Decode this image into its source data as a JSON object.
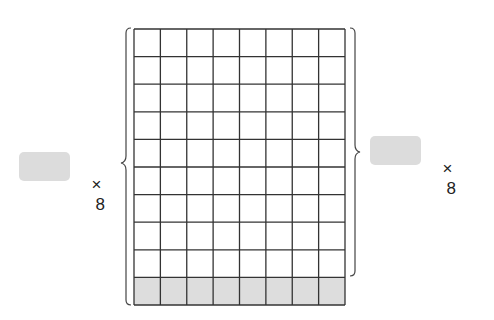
{
  "left_expression": {
    "blank": "",
    "operator": "×",
    "multiplier": "8"
  },
  "right_expression": {
    "blank": "",
    "operator": "×",
    "multiplier": "8"
  },
  "grid": {
    "columns": 8,
    "rows": 10,
    "shaded_rows": [
      9
    ],
    "line_color": "#333333",
    "shade_color": "#dddddd",
    "x": 134,
    "y": 29,
    "width": 211,
    "height": 276
  },
  "braces": {
    "left": {
      "spans_rows": 10,
      "label": "× 8"
    },
    "right": {
      "spans_rows": 9,
      "label": "× 8"
    }
  }
}
